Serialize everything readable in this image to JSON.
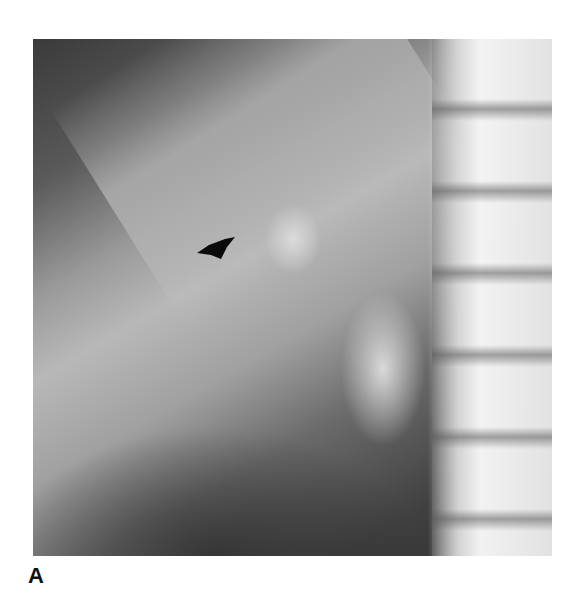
{
  "figure": {
    "panel_label": "A",
    "image_description": "Radiograph (X-ray) with a black arrowhead marker",
    "marker": "arrow-icon"
  }
}
